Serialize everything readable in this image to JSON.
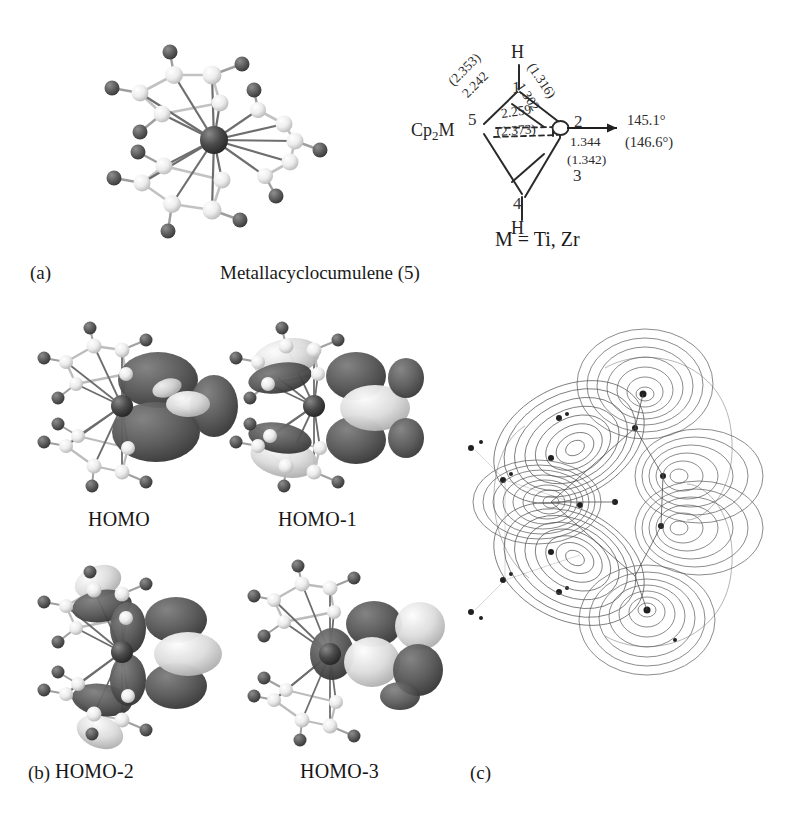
{
  "figure": {
    "panels": [
      {
        "id": "a",
        "letter": "(a)",
        "caption": "Metallacyclocumulene (5)"
      },
      {
        "id": "b",
        "letter": "(b)",
        "caption": ""
      },
      {
        "id": "c",
        "letter": "(c)",
        "caption": ""
      }
    ]
  },
  "panel_a": {
    "letter": "(a)",
    "caption": "Metallacyclocumulene (5)",
    "structure_name": "ball-and-stick-model",
    "skeletal": {
      "metal_label_pre": "Cp",
      "metal_label_sub": "2",
      "metal_label_post": "M",
      "h_top": "H",
      "h_bottom": "H",
      "ring_numbers": [
        "1",
        "2",
        "3",
        "4",
        "5"
      ],
      "bond_M5_top": "(2.353)",
      "bond_M5": "2.242",
      "bond_C1C2_top": "(1.316)",
      "bond_C1C2": "1.302",
      "bond_M_inner": "2.259",
      "bond_M_inner_paren": "(2.373)",
      "bond_C2C3": "1.344",
      "bond_C2C3_paren": "(1.342)",
      "angle": "145.1°",
      "angle_paren": "(146.6°)",
      "metal_definition": "M = Ti, Zr"
    }
  },
  "panel_b": {
    "letter": "(b)",
    "orbitals": [
      {
        "label": "HOMO",
        "name": "homo-isosurface"
      },
      {
        "label": "HOMO-1",
        "name": "homo-1-isosurface"
      },
      {
        "label": "HOMO-2",
        "name": "homo-2-isosurface"
      },
      {
        "label": "HOMO-3",
        "name": "homo-3-isosurface"
      }
    ]
  },
  "panel_c": {
    "letter": "(c)",
    "plot_name": "electron-density-contour-map"
  },
  "colors": {
    "background": "#ffffff",
    "text": "#1a1a1a",
    "metal_atom": "#4a4a4a",
    "carbon_atom": "#e8e8e8",
    "hydrogen_atom": "#5a5a5a",
    "bond_light": "#bdbdbd",
    "bond_dark": "#6a6a6a",
    "lobe_dark": "#595959",
    "lobe_light": "#d9d9d9",
    "contour_line": "#4e4e4e"
  }
}
